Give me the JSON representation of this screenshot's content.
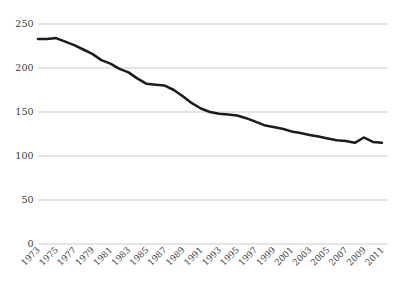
{
  "chart_style": {
    "background": "#ffffff",
    "line_color": "#1c1c1c",
    "grid_color": "#c9c9c9",
    "label_color": "#3d3d3d"
  },
  "chart_data": {
    "type": "line",
    "title": "",
    "xlabel": "",
    "ylabel": "",
    "x": [
      1973,
      1974,
      1975,
      1976,
      1977,
      1978,
      1979,
      1980,
      1981,
      1982,
      1983,
      1984,
      1985,
      1986,
      1987,
      1988,
      1989,
      1990,
      1991,
      1992,
      1993,
      1994,
      1995,
      1996,
      1997,
      1998,
      1999,
      2000,
      2001,
      2002,
      2003,
      2004,
      2005,
      2006,
      2007,
      2008,
      2009,
      2010,
      2011
    ],
    "series": [
      {
        "name": "value",
        "values": [
          233,
          233,
          234,
          230,
          226,
          221,
          216,
          209,
          205,
          199,
          195,
          188,
          182,
          181,
          180,
          175,
          168,
          160,
          154,
          150,
          148,
          147,
          146,
          143,
          139,
          135,
          133,
          131,
          128,
          126,
          124,
          122,
          120,
          118,
          117,
          115,
          121,
          116,
          115
        ]
      }
    ],
    "x_tick_labels": [
      "1973",
      "1975",
      "1977",
      "1979",
      "1981",
      "1983",
      "1985",
      "1987",
      "1989",
      "1991",
      "1993",
      "1995",
      "1997",
      "1999",
      "2001",
      "2003",
      "2005",
      "2007",
      "2009",
      "2011"
    ],
    "y_tick_labels": [
      "0",
      "50",
      "100",
      "150",
      "200",
      "250"
    ],
    "y_ticks": [
      0,
      50,
      100,
      150,
      200,
      250
    ],
    "ylim": [
      0,
      250
    ],
    "grid": "horizontal-only",
    "legend": "none"
  }
}
